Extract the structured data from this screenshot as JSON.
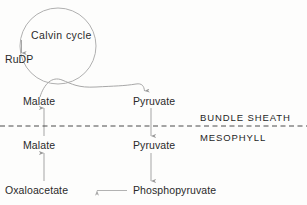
{
  "diagram": {
    "title_text_present": false,
    "background_color": "#fdfdfc",
    "stroke_color": "#9a9a9a",
    "text_color": "#2a2a2a",
    "compartment_text_color": "#1f1f1f",
    "cycle": {
      "label": "Calvin cycle",
      "shape": "circle"
    },
    "metabolites": {
      "rudp": "RuDP",
      "malate_bundle_sheath": "Malate",
      "pyruvate_bundle_sheath": "Pyruvate",
      "malate_mesophyll": "Malate",
      "pyruvate_mesophyll": "Pyruvate",
      "oxaloacetate": "Oxaloacetate",
      "phosphopyruvate": "Phosphopyruvate"
    },
    "compartments": {
      "upper": "BUNDLE SHEATH",
      "lower": "MESOPHYLL"
    },
    "boundary": {
      "style": "dashed",
      "y": 126
    },
    "arrows": [
      {
        "name": "cycle-to-rudp",
        "from": "Calvin cycle",
        "to": "RuDP",
        "direction": "down"
      },
      {
        "name": "malate-bs-to-cycle-to-pyruvate-bs",
        "from": "Malate",
        "to": "Pyruvate",
        "direction": "curved-right"
      },
      {
        "name": "malate-ms-to-malate-bs",
        "from": "Malate",
        "to": "Malate",
        "direction": "up"
      },
      {
        "name": "oxaloacetate-to-malate-ms",
        "from": "Oxaloacetate",
        "to": "Malate",
        "direction": "up"
      },
      {
        "name": "pyruvate-bs-to-pyruvate-ms",
        "from": "Pyruvate",
        "to": "Pyruvate",
        "direction": "down"
      },
      {
        "name": "pyruvate-ms-to-phosphopyruvate",
        "from": "Pyruvate",
        "to": "Phosphopyruvate",
        "direction": "down"
      },
      {
        "name": "phosphopyruvate-to-oxaloacetate",
        "from": "Phosphopyruvate",
        "to": "Oxaloacetate",
        "direction": "left"
      }
    ]
  }
}
